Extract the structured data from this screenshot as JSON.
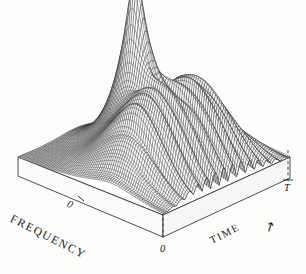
{
  "figure": {
    "type": "surface-3d",
    "background_color": "#fdfdfc",
    "line_color": "#2a2a2a",
    "fill_color": "#b9b9b9"
  },
  "axes": {
    "frequency": {
      "label": "FREQUENCY",
      "ticks": [
        {
          "value": "0"
        }
      ]
    },
    "time": {
      "label": "TIME",
      "arrow": "↗",
      "ticks": [
        {
          "value": "0"
        },
        {
          "value": "T"
        }
      ]
    }
  },
  "chart_data": {
    "type": "surface",
    "title": "",
    "xlabel": "TIME",
    "ylabel": "FREQUENCY",
    "zlabel": "",
    "x_ticks": [
      "0",
      "T"
    ],
    "y_ticks": [
      "0"
    ],
    "grid": false,
    "legend": null,
    "features": [
      {
        "name": "main-peak",
        "shape": "sharp-tall-ridge",
        "peak_height_rel": 1.0
      },
      {
        "name": "secondary-ridge-left",
        "shape": "broad-hump",
        "peak_height_rel": 0.34
      },
      {
        "name": "secondary-ridge-right",
        "shape": "broad-hump",
        "peak_height_rel": 0.3
      },
      {
        "name": "interference-ripples",
        "shape": "oscillatory-front-lobes",
        "peak_height_rel": 0.22
      }
    ],
    "surface_points_note": "time-frequency distribution magnitude surface"
  }
}
